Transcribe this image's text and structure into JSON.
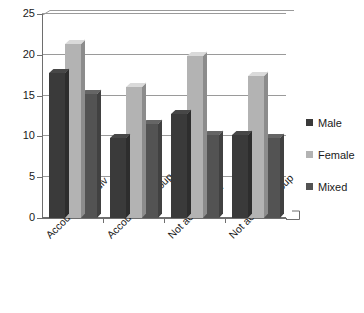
{
  "chart_data": {
    "type": "bar",
    "title": "",
    "xlabel": "",
    "ylabel": "",
    "categories": [
      "Accountable indiv",
      "Accountable group",
      "Not account ind",
      "Not account group"
    ],
    "series": [
      {
        "name": "Male",
        "color": "#3a3a3a",
        "values": [
          17.8,
          9.8,
          12.8,
          10.2
        ]
      },
      {
        "name": "Female",
        "color": "#b3b3b3",
        "values": [
          21.3,
          16.0,
          19.8,
          17.4
        ]
      },
      {
        "name": "Mixed",
        "color": "#535353",
        "values": [
          15.2,
          11.5,
          10.2,
          9.8
        ]
      }
    ],
    "ylim": [
      0,
      25
    ],
    "yticks": [
      0,
      5,
      10,
      15,
      20,
      25
    ],
    "ytick_labels": [
      "0",
      "5",
      "10",
      "15",
      "20",
      "25"
    ],
    "grid": true,
    "legend_position": "right",
    "style": "3d-clustered-column"
  },
  "axes": {
    "y_tick_labels": [
      "25",
      "20",
      "15",
      "10",
      "5",
      "0"
    ]
  },
  "legend": {
    "entries": [
      {
        "label": "Male",
        "swatch": "#3a3a3a"
      },
      {
        "label": "Female",
        "swatch": "#b3b3b3"
      },
      {
        "label": "Mixed",
        "swatch": "#535353"
      }
    ]
  }
}
